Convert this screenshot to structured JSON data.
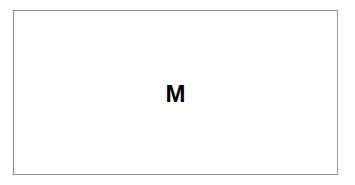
{
  "card": {
    "label": "M"
  },
  "colors": {
    "border": "#8a8a8a",
    "background": "#ffffff",
    "text": "#000000"
  }
}
